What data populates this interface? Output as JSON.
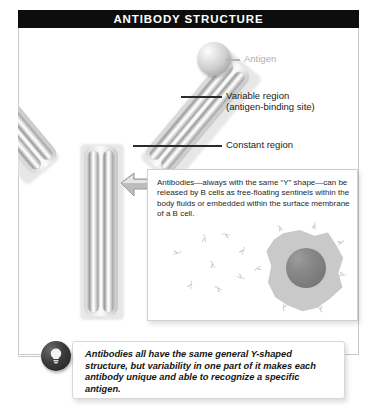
{
  "header": {
    "title": "ANTIBODY STRUCTURE"
  },
  "labels": {
    "antigen": "Antigen",
    "variable_region_line1": "Variable region",
    "variable_region_line2": "(antigen-binding site)",
    "constant_region": "Constant region"
  },
  "callout": {
    "text": "Antibodies—always with the same “Y” shape—can be released by B cells as free-floating sentinels within the body fluids or embedded within the surface membrane of a B cell."
  },
  "summary": {
    "text": "Antibodies all have the same general Y-shaped structure, but variability in one part of it makes each antibody unique and able to recognize a specific antigen.",
    "icon": "lightbulb-icon"
  },
  "diagram": {
    "antigen_icon": "antigen-sphere",
    "antibody_icon": "y-shaped-antibody",
    "pointer_icon": "callout-arrow-icon",
    "bcell_icon": "b-cell",
    "free_antibody_icon": "free-floating-antibody",
    "membrane_antibody_icon": "membrane-bound-antibody"
  },
  "colors": {
    "banner": "#0d0d0d",
    "banner_text": "#ffffff",
    "frame": "#c9c9c9",
    "body_text": "#1a1a1a",
    "faint_label": "#b0b0b0",
    "background": "#ffffff"
  }
}
